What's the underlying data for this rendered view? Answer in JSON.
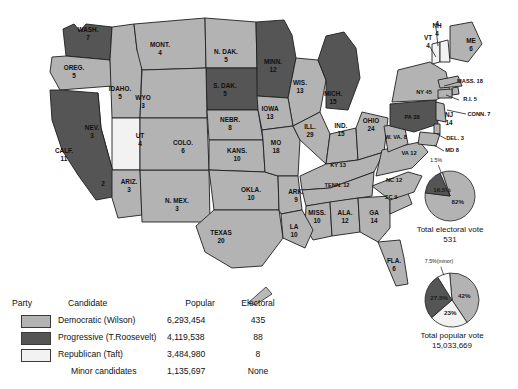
{
  "colors": {
    "democratic": "#b3b3b3",
    "progressive": "#555555",
    "republican": "#f2f2f2",
    "minor": "#ffffff",
    "border": "#1f1f1f",
    "water": "#ffffff"
  },
  "states": [
    {
      "name": "WASH.",
      "votes": "7",
      "party": "progressive",
      "lx": 88,
      "ly": 34
    },
    {
      "name": "OREG.",
      "votes": "5",
      "party": "democratic",
      "lx": 74,
      "ly": 72
    },
    {
      "name": "IDAHO.",
      "votes": "5",
      "party": "democratic",
      "lx": 120,
      "ly": 93
    },
    {
      "name": "MONT.",
      "votes": "4",
      "party": "democratic",
      "lx": 160,
      "ly": 49
    },
    {
      "name": "N. DAK.",
      "votes": "5",
      "party": "democratic",
      "lx": 226,
      "ly": 56
    },
    {
      "name": "S. DAK.",
      "votes": "5",
      "party": "progressive",
      "lx": 225,
      "ly": 90
    },
    {
      "name": "MINN.",
      "votes": "12",
      "party": "progressive",
      "lx": 273,
      "ly": 66
    },
    {
      "name": "WIS.",
      "votes": "13",
      "party": "democratic",
      "lx": 300,
      "ly": 87
    },
    {
      "name": "MICH.",
      "votes": "15",
      "party": "progressive",
      "lx": 333,
      "ly": 98
    },
    {
      "name": "WYO",
      "votes": "3",
      "party": "democratic",
      "lx": 143,
      "ly": 102
    },
    {
      "name": "NEV.",
      "votes": "3",
      "party": "democratic",
      "lx": 92,
      "ly": 132
    },
    {
      "name": "UT",
      "votes": "4",
      "party": "republican",
      "lx": 140,
      "ly": 140
    },
    {
      "name": "CALF.",
      "votes": "11",
      "party": "progressive",
      "lx": 64,
      "ly": 155
    },
    {
      "name": "ARIZ.",
      "votes": "3",
      "party": "democratic",
      "lx": 129,
      "ly": 186
    },
    {
      "name": "N. MEX.",
      "votes": "3",
      "party": "democratic",
      "lx": 177,
      "ly": 205
    },
    {
      "name": "COLO.",
      "votes": "6",
      "party": "democratic",
      "lx": 183,
      "ly": 147
    },
    {
      "name": "NEBR.",
      "votes": "8",
      "party": "democratic",
      "lx": 230,
      "ly": 124
    },
    {
      "name": "KANS.",
      "votes": "10",
      "party": "democratic",
      "lx": 237,
      "ly": 155
    },
    {
      "name": "OKLA.",
      "votes": "10",
      "party": "democratic",
      "lx": 251,
      "ly": 194
    },
    {
      "name": "TEXAS",
      "votes": "20",
      "party": "democratic",
      "lx": 221,
      "ly": 237
    },
    {
      "name": "IOWA",
      "votes": "13",
      "party": "democratic",
      "lx": 270,
      "ly": 113
    },
    {
      "name": "MO",
      "votes": "18",
      "party": "democratic",
      "lx": 276,
      "ly": 147
    },
    {
      "name": "ILL.",
      "votes": "29",
      "party": "democratic",
      "lx": 310,
      "ly": 131
    },
    {
      "name": "IND.",
      "votes": "15",
      "party": "democratic",
      "lx": 341,
      "ly": 130
    },
    {
      "name": "OHIO",
      "votes": "24",
      "party": "democratic",
      "lx": 371,
      "ly": 125
    },
    {
      "name": "KY",
      "votes": "13",
      "party": "democratic",
      "lx": 338,
      "ly": 165
    },
    {
      "name": "TENN.",
      "votes": "12",
      "party": "democratic",
      "lx": 337,
      "ly": 185
    },
    {
      "name": "ARK.",
      "votes": "9",
      "party": "democratic",
      "lx": 296,
      "ly": 196
    },
    {
      "name": "MISS.",
      "votes": "10",
      "party": "democratic",
      "lx": 317,
      "ly": 217
    },
    {
      "name": "ALA.",
      "votes": "12",
      "party": "democratic",
      "lx": 345,
      "ly": 217
    },
    {
      "name": "GA",
      "votes": "14",
      "party": "democratic",
      "lx": 374,
      "ly": 217
    },
    {
      "name": "LA",
      "votes": "10",
      "party": "democratic",
      "lx": 294,
      "ly": 231
    },
    {
      "name": "FLA.",
      "votes": "6",
      "party": "democratic",
      "lx": 394,
      "ly": 265
    },
    {
      "name": "SC",
      "votes": "9",
      "party": "democratic",
      "lx": 391,
      "ly": 197
    },
    {
      "name": "NC",
      "votes": "12",
      "party": "democratic",
      "lx": 394,
      "ly": 180
    },
    {
      "name": "VA",
      "votes": "12",
      "party": "democratic",
      "lx": 409,
      "ly": 153
    },
    {
      "name": "W. VA.",
      "votes": "8",
      "party": "democratic",
      "lx": 396,
      "ly": 137
    },
    {
      "name": "PA",
      "votes": "38",
      "party": "progressive",
      "lx": 412,
      "ly": 117
    },
    {
      "name": "NY",
      "votes": "45",
      "party": "democratic",
      "lx": 424,
      "ly": 92
    },
    {
      "name": "VT",
      "votes": "4",
      "party": "republican",
      "lx": 428,
      "ly": 42
    },
    {
      "name": "NH",
      "votes": "4",
      "party": "republican",
      "lx": 437,
      "ly": 30
    },
    {
      "name": "ME",
      "votes": "6",
      "party": "democratic",
      "lx": 471,
      "ly": 45
    },
    {
      "name": "MASS.",
      "votes": "18",
      "party": "democratic",
      "lx": 470,
      "ly": 81
    },
    {
      "name": "R.I.",
      "votes": "5",
      "party": "democratic",
      "lx": 470,
      "ly": 99
    },
    {
      "name": "CONN.",
      "votes": "7",
      "party": "democratic",
      "lx": 479,
      "ly": 114
    },
    {
      "name": "NJ",
      "votes": "14",
      "party": "democratic",
      "lx": 449,
      "ly": 119
    },
    {
      "name": "DEL.",
      "votes": "3",
      "party": "democratic",
      "lx": 455,
      "ly": 138
    },
    {
      "name": "MD",
      "votes": "8",
      "party": "democratic",
      "lx": 452,
      "ly": 150
    }
  ],
  "map_annotations": [
    {
      "text": "2",
      "x": 103,
      "y": 184
    },
    {
      "text": "4",
      "x": 437,
      "y": 24
    }
  ],
  "electoral_pie": {
    "caption_line1": "Total electoral vote",
    "caption_line2": "531",
    "slices": [
      {
        "label": "82%",
        "value": 82,
        "party": "democratic"
      },
      {
        "label": "16.5%",
        "value": 16.5,
        "party": "progressive"
      },
      {
        "label": "1.5%",
        "value": 1.5,
        "party": "republican"
      }
    ]
  },
  "popular_pie": {
    "caption_line1": "Total popular vote",
    "caption_line2": "15,033,669",
    "slices": [
      {
        "label": "42%",
        "value": 42,
        "party": "democratic"
      },
      {
        "label": "23%",
        "value": 23,
        "party": "republican"
      },
      {
        "label": "27.5%",
        "value": 27.5,
        "party": "progressive"
      },
      {
        "label": "7.5%(minor)",
        "value": 7.5,
        "party": "minor"
      }
    ]
  },
  "legend": {
    "headers": {
      "party": "Party",
      "candidate": "Candidate",
      "popular": "Popular",
      "electoral": "Electoral"
    },
    "rows": [
      {
        "candidate": "Democratic (Wilson)",
        "popular": "6,293,454",
        "electoral": "435",
        "party": "democratic",
        "swatch": true
      },
      {
        "candidate": "Progressive (T.Roosevelt)",
        "popular": "4,119,538",
        "electoral": "88",
        "party": "progressive",
        "swatch": true
      },
      {
        "candidate": "Republican (Taft)",
        "popular": "3,484,980",
        "electoral": "8",
        "party": "republican",
        "swatch": true
      },
      {
        "candidate": "Minor candidates",
        "popular": "1,135,697",
        "electoral": "None",
        "party": "minor",
        "swatch": false
      }
    ]
  }
}
